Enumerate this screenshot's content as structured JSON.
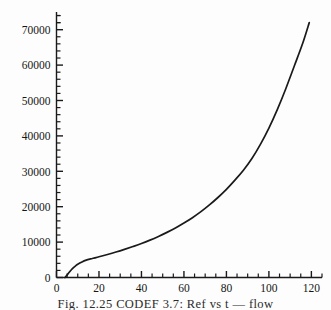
{
  "figure": {
    "caption": "Fig. 12.25 CODEF 3.7: Ref vs t — flow",
    "background_color": "#fdfdfd",
    "line_color": "#1a1a1a"
  },
  "chart_data": {
    "type": "line",
    "title": "",
    "xlabel": "",
    "ylabel": "",
    "xlim": [
      0,
      125
    ],
    "ylim": [
      0,
      75000
    ],
    "grid": false,
    "legend": null,
    "x_ticks_major": [
      0,
      20,
      40,
      60,
      80,
      100,
      120
    ],
    "x_tick_labels": [
      "0",
      "20",
      "40",
      "60",
      "80",
      "100",
      "120"
    ],
    "x_tick_minor_step": 5,
    "y_ticks_major": [
      0,
      10000,
      20000,
      30000,
      40000,
      50000,
      60000,
      70000
    ],
    "y_tick_labels": [
      "0",
      "10000",
      "20000",
      "30000",
      "40000",
      "50000",
      "60000",
      "70000"
    ],
    "y_tick_minor_step": 2000,
    "series": [
      {
        "name": "curve",
        "x": [
          4,
          5,
          6,
          7,
          8,
          9,
          10,
          12,
          14,
          16,
          18,
          20,
          24,
          28,
          32,
          36,
          40,
          44,
          48,
          52,
          56,
          60,
          64,
          68,
          72,
          76,
          80,
          84,
          88,
          92,
          96,
          100,
          104,
          108,
          112,
          116,
          119
        ],
        "y": [
          0,
          700,
          1500,
          2200,
          2800,
          3300,
          3750,
          4400,
          4900,
          5250,
          5550,
          5850,
          6500,
          7200,
          7950,
          8750,
          9600,
          10550,
          11600,
          12750,
          14000,
          15400,
          16900,
          18600,
          20500,
          22600,
          24900,
          27500,
          30300,
          33600,
          37600,
          42200,
          47500,
          53400,
          59800,
          66300,
          72000
        ]
      }
    ]
  }
}
